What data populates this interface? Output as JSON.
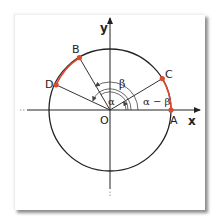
{
  "diagram": {
    "colors": {
      "axis": "#222222",
      "circle": "#222222",
      "radius": "#333333",
      "arc_highlight": "#e0472b",
      "point": "#e0472b",
      "angle_marks": "#444444"
    },
    "axes": {
      "x_label": "x",
      "y_label": "y",
      "origin_label": "O"
    },
    "points": [
      {
        "label": "A",
        "angle_deg": 0
      },
      {
        "label": "B",
        "angle_deg": 121
      },
      {
        "label": "C",
        "angle_deg": 31
      },
      {
        "label": "D",
        "angle_deg": 152
      }
    ],
    "angles": [
      {
        "label": "α",
        "from": "A",
        "to": "B"
      },
      {
        "label": "β",
        "from": "A",
        "to": "C"
      },
      {
        "label": "α − β",
        "from": "A",
        "to": "C"
      }
    ],
    "highlighted_arcs": [
      {
        "from": "D",
        "to": "B"
      },
      {
        "from": "A",
        "to": "C"
      }
    ]
  }
}
